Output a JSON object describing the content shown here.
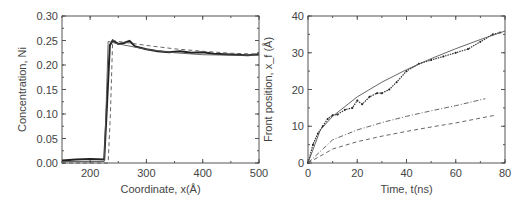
{
  "chart_data": [
    {
      "type": "line",
      "title": "",
      "xlabel": "Coordinate, x(Å)",
      "ylabel": "Concentration, Ni",
      "xlim": [
        150,
        500
      ],
      "ylim": [
        0.0,
        0.3
      ],
      "xticks": [
        "200",
        "300",
        "400",
        "500"
      ],
      "yticks": [
        "0.00",
        "0.05",
        "0.10",
        "0.15",
        "0.20",
        "0.25",
        "0.30"
      ],
      "grid": false,
      "legend": null,
      "series": [
        {
          "name": "simulation (thick noisy)",
          "style": "solid-thick",
          "x": [
            150,
            175,
            200,
            225,
            230,
            235,
            240,
            250,
            260,
            270,
            280,
            300,
            320,
            340,
            360,
            380,
            400,
            420,
            440,
            460,
            480,
            500
          ],
          "y": [
            0.005,
            0.007,
            0.008,
            0.007,
            0.12,
            0.24,
            0.25,
            0.243,
            0.245,
            0.249,
            0.238,
            0.232,
            0.228,
            0.226,
            0.228,
            0.225,
            0.226,
            0.223,
            0.222,
            0.221,
            0.22,
            0.222
          ]
        },
        {
          "name": "model (thin solid)",
          "style": "solid-thin",
          "x": [
            150,
            225,
            228,
            232,
            250,
            300,
            350,
            400,
            450,
            500
          ],
          "y": [
            0.003,
            0.003,
            0.1,
            0.248,
            0.243,
            0.232,
            0.225,
            0.221,
            0.22,
            0.22
          ]
        },
        {
          "name": "model (dashed)",
          "style": "dashed",
          "x": [
            150,
            232,
            236,
            240,
            250,
            300,
            350,
            400,
            450,
            500
          ],
          "y": [
            0.0,
            0.0,
            0.1,
            0.25,
            0.248,
            0.24,
            0.233,
            0.228,
            0.224,
            0.222
          ]
        }
      ]
    },
    {
      "type": "line",
      "title": "",
      "xlabel": "Time, t(ns)",
      "ylabel": "Front position, x_f (Å)",
      "xlim": [
        0,
        80
      ],
      "ylim": [
        0,
        40
      ],
      "xticks": [
        "0",
        "20",
        "40",
        "60",
        "80"
      ],
      "yticks": [
        "0",
        "10",
        "20",
        "30",
        "40"
      ],
      "grid": false,
      "legend": null,
      "series": [
        {
          "name": "simulation (dots)",
          "style": "dots",
          "x": [
            0,
            2,
            4,
            6,
            8,
            10,
            12,
            15,
            18,
            20,
            22,
            25,
            28,
            30,
            33,
            36,
            40,
            45,
            50,
            55,
            60,
            65,
            70,
            75,
            78
          ],
          "y": [
            0,
            5,
            8,
            10,
            12,
            13,
            13.2,
            14.5,
            15,
            17,
            16,
            18,
            19,
            19,
            20,
            22,
            25,
            27,
            28,
            29,
            30,
            31,
            33,
            35,
            35.5
          ]
        },
        {
          "name": "fit (solid)",
          "style": "solid",
          "x": [
            0,
            5,
            10,
            20,
            30,
            40,
            50,
            60,
            70,
            80
          ],
          "y": [
            0,
            9,
            12.7,
            18,
            22,
            25.4,
            28.4,
            31.1,
            33.6,
            35.9
          ]
        },
        {
          "name": "dash-dot",
          "style": "dashdot",
          "x": [
            0,
            10,
            20,
            30,
            40,
            50,
            60,
            72
          ],
          "y": [
            0,
            6.3,
            9,
            11,
            12.7,
            14.2,
            15.6,
            17.5
          ]
        },
        {
          "name": "dashed",
          "style": "dashed",
          "x": [
            0,
            10,
            20,
            30,
            40,
            50,
            60,
            76
          ],
          "y": [
            0,
            3.8,
            5.8,
            7.3,
            8.6,
            9.8,
            10.9,
            13
          ]
        }
      ]
    }
  ]
}
